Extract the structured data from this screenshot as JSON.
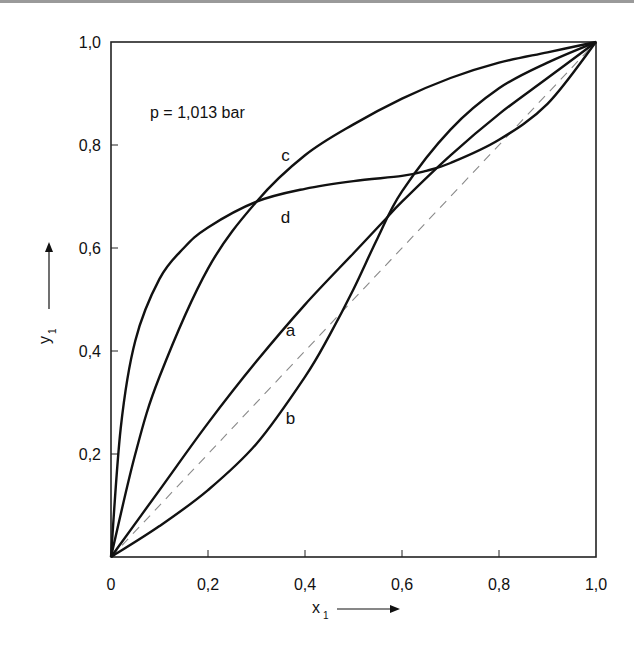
{
  "chart_data": {
    "type": "line",
    "title": "",
    "annotation": "p = 1,013 bar",
    "xlabel": "x",
    "xlabel_sub": "1",
    "ylabel": "y",
    "ylabel_sub": "1",
    "xlim": [
      0,
      1
    ],
    "ylim": [
      0,
      1
    ],
    "grid": false,
    "legend": "none (curves labeled inline)",
    "x_ticks": [
      "0",
      "0,2",
      "0,4",
      "0,6",
      "0,8",
      "1,0"
    ],
    "y_ticks": [
      "0,2",
      "0,4",
      "0,6",
      "0,8",
      "1,0"
    ],
    "reference_line": {
      "name": "diagonal",
      "style": "dashed",
      "points": [
        [
          0,
          0
        ],
        [
          1,
          1
        ]
      ]
    },
    "series": [
      {
        "name": "a",
        "label_pos": [
          0.37,
          0.44
        ],
        "x": [
          0,
          0.1,
          0.2,
          0.3,
          0.4,
          0.5,
          0.56,
          0.6,
          0.7,
          0.8,
          0.9,
          1.0
        ],
        "y": [
          0,
          0.13,
          0.26,
          0.38,
          0.49,
          0.59,
          0.65,
          0.69,
          0.78,
          0.86,
          0.93,
          1.0
        ]
      },
      {
        "name": "b",
        "label_pos": [
          0.37,
          0.27
        ],
        "x": [
          0,
          0.1,
          0.2,
          0.3,
          0.4,
          0.45,
          0.5,
          0.55,
          0.6,
          0.7,
          0.8,
          0.9,
          1.0
        ],
        "y": [
          0,
          0.06,
          0.13,
          0.22,
          0.35,
          0.43,
          0.52,
          0.62,
          0.71,
          0.83,
          0.91,
          0.96,
          1.0
        ]
      },
      {
        "name": "c",
        "label_pos": [
          0.36,
          0.78
        ],
        "x": [
          0,
          0.05,
          0.1,
          0.2,
          0.3,
          0.4,
          0.5,
          0.6,
          0.7,
          0.8,
          0.9,
          1.0
        ],
        "y": [
          0,
          0.2,
          0.35,
          0.56,
          0.69,
          0.78,
          0.84,
          0.89,
          0.93,
          0.96,
          0.98,
          1.0
        ]
      },
      {
        "name": "d",
        "label_pos": [
          0.36,
          0.66
        ],
        "x": [
          0,
          0.02,
          0.05,
          0.1,
          0.15,
          0.2,
          0.3,
          0.4,
          0.5,
          0.6,
          0.65,
          0.7,
          0.8,
          0.9,
          1.0
        ],
        "y": [
          0,
          0.25,
          0.42,
          0.54,
          0.6,
          0.64,
          0.69,
          0.715,
          0.73,
          0.74,
          0.75,
          0.765,
          0.81,
          0.88,
          1.0
        ]
      }
    ]
  },
  "colors": {
    "curve": "#111111",
    "frame": "#222222",
    "diagonal": "#8a8a8a",
    "topbar": "#9a9a9a"
  }
}
